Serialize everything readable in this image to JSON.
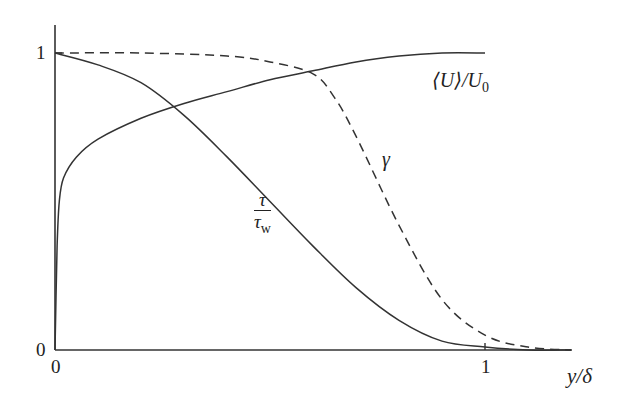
{
  "chart_data": {
    "type": "line",
    "title": "",
    "xlabel": "y/δ",
    "ylabel": "",
    "xlim": [
      0,
      1.2
    ],
    "ylim": [
      0,
      1.0
    ],
    "grid": false,
    "legend": "inline curve labels",
    "x_ticks": [
      "0",
      "1"
    ],
    "y_ticks": [
      "0",
      "1"
    ],
    "series": [
      {
        "name": "⟨U⟩/U0",
        "style": "solid",
        "x": [
          0.0,
          0.005,
          0.01,
          0.02,
          0.05,
          0.1,
          0.2,
          0.3,
          0.4,
          0.5,
          0.6,
          0.7,
          0.8,
          0.9,
          1.0
        ],
        "y": [
          0.0,
          0.35,
          0.5,
          0.58,
          0.65,
          0.71,
          0.78,
          0.83,
          0.87,
          0.91,
          0.94,
          0.97,
          0.99,
          1.0,
          1.0
        ]
      },
      {
        "name": "τ/τw",
        "style": "solid",
        "x": [
          0.0,
          0.1,
          0.2,
          0.3,
          0.4,
          0.5,
          0.6,
          0.7,
          0.8,
          0.9,
          1.0,
          1.1,
          1.2
        ],
        "y": [
          1.0,
          0.96,
          0.9,
          0.79,
          0.65,
          0.5,
          0.35,
          0.21,
          0.1,
          0.03,
          0.01,
          0.0,
          0.0
        ]
      },
      {
        "name": "γ",
        "style": "dashed",
        "x": [
          0.0,
          0.2,
          0.4,
          0.5,
          0.6,
          0.65,
          0.7,
          0.8,
          0.9,
          1.0,
          1.1,
          1.2
        ],
        "y": [
          1.0,
          1.0,
          0.99,
          0.97,
          0.93,
          0.85,
          0.72,
          0.42,
          0.17,
          0.05,
          0.01,
          0.0
        ]
      }
    ],
    "annotations": [
      "⟨U⟩/U0",
      "γ",
      "τ/τw"
    ]
  },
  "labels": {
    "y_tick_1": "1",
    "y_tick_0": "0",
    "x_tick_0": "0",
    "x_tick_1": "1",
    "x_axis_label": "y/δ",
    "u_label_main": "⟨U⟩/U",
    "u_label_sub": "0",
    "gamma_label": "γ",
    "tau_num": "τ",
    "tau_den": "τ",
    "tau_den_sub": "w"
  }
}
